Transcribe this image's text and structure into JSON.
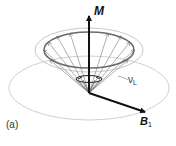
{
  "figure": {
    "panel_label": "(a)",
    "vectors": {
      "magnetization": {
        "symbol": "M"
      },
      "rf_field": {
        "symbol": "B",
        "subscript": "1"
      }
    },
    "precession": {
      "symbol": "ν",
      "subscript": "L"
    }
  },
  "colors": {
    "vector": "#111111",
    "cone_rim": "#6a6a6a",
    "guide_ellipse": "#c8c8c8",
    "cone_arrows": "#9a9a9a"
  }
}
